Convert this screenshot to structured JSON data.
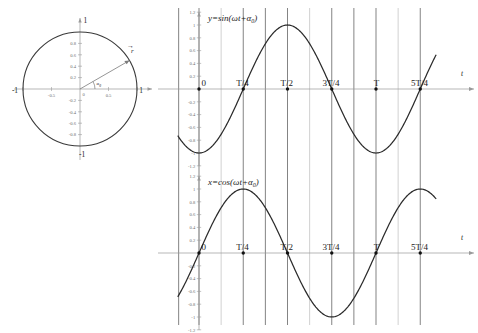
{
  "figure": {
    "background": "#ffffff",
    "curve_color": "#2b2b2b",
    "axis_color": "#9a9a9a",
    "gridline_color": "#6e6e6e"
  },
  "unit_circle": {
    "name": "unit-circle-phasor",
    "radius_label": "r",
    "angle_label": "α",
    "angle_sub": "0",
    "axis_labels": {
      "left": "-1",
      "right": "1",
      "top": "1",
      "bottom": "-1"
    },
    "x_ticks": [
      "-1",
      "-0.5",
      "0",
      "0.5",
      "1"
    ],
    "y_ticks": [
      "1",
      "0.8",
      "0.6",
      "0.4",
      "0.2",
      "0",
      "-0.2",
      "-0.4",
      "-0.6",
      "-0.8",
      "-1"
    ],
    "angle_deg": 30,
    "x_axis_name": "",
    "y_axis_name": ""
  },
  "chart_data": [
    {
      "type": "line",
      "name": "sine-plot",
      "title": "y=sin(ωt+α",
      "title_sub": "0",
      "title_tail": ")",
      "function": "sin",
      "phase_offset_turns": -0.25,
      "amplitude": 1,
      "xlabel": "t",
      "ylabel": "y",
      "categories": [
        "0",
        "T/4",
        "T/2",
        "3T/4",
        "T",
        "5T/4"
      ],
      "x_tick_values": [
        0,
        0.25,
        0.5,
        0.75,
        1.0,
        1.25
      ],
      "y_ticks": [
        "1.2",
        "1",
        "0.8",
        "0.6",
        "0.4",
        "0.2",
        "-0.2",
        "-0.4",
        "-0.6",
        "-0.8",
        "-1",
        "-1.2"
      ],
      "y_tick_values": [
        1.2,
        1.0,
        0.8,
        0.6,
        0.4,
        0.2,
        -0.2,
        -0.4,
        -0.6,
        -0.8,
        -1.0,
        -1.2
      ],
      "ylim": [
        -1.3,
        1.3
      ],
      "xlim": [
        -0.12,
        1.34
      ],
      "grid": true,
      "marked_points": [
        "0",
        "T/4",
        "T/2",
        "3T/4",
        "T",
        "5T/4"
      ],
      "values_at_ticks": [
        -1,
        0,
        1,
        0,
        -1,
        0
      ]
    },
    {
      "type": "line",
      "name": "cosine-plot",
      "title": "x=cos(ωt+α",
      "title_sub": "0",
      "title_tail": ")",
      "function": "cos",
      "phase_offset_turns": -0.25,
      "amplitude": 1,
      "xlabel": "t",
      "ylabel": "x",
      "categories": [
        "0",
        "T/4",
        "T/2",
        "3T/4",
        "T",
        "5T/4"
      ],
      "x_tick_values": [
        0,
        0.25,
        0.5,
        0.75,
        1.0,
        1.25
      ],
      "y_ticks": [
        "1.2",
        "1",
        "0.8",
        "0.6",
        "0.4",
        "0.2",
        "-0.2",
        "-0.4",
        "-0.6",
        "-0.8",
        "-1",
        "-1.2"
      ],
      "y_tick_values": [
        1.2,
        1.0,
        0.8,
        0.6,
        0.4,
        0.2,
        -0.2,
        -0.4,
        -0.6,
        -0.8,
        -1.0,
        -1.2
      ],
      "ylim": [
        -1.3,
        1.3
      ],
      "xlim": [
        -0.12,
        1.34
      ],
      "grid": true,
      "marked_points": [
        "0",
        "T/4",
        "T/2",
        "3T/4",
        "T",
        "5T/4"
      ],
      "values_at_ticks": [
        0,
        1,
        0,
        -1,
        0,
        1
      ]
    }
  ]
}
